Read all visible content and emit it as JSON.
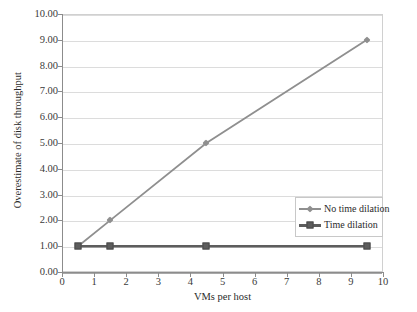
{
  "chart_data": {
    "type": "line",
    "title": "",
    "xlabel": "VMs per host",
    "ylabel": "Overestimate of disk throughput",
    "xlim": [
      0,
      10
    ],
    "ylim": [
      0,
      10
    ],
    "grid": "horizontal",
    "legend_position": "inside-right",
    "x_ticks": [
      "0",
      "1",
      "2",
      "3",
      "4",
      "5",
      "6",
      "7",
      "8",
      "9",
      "10"
    ],
    "x_tick_values": [
      0,
      1,
      2,
      3,
      4,
      5,
      6,
      7,
      8,
      9,
      10
    ],
    "y_ticks": [
      "0.00",
      "1.00",
      "2.00",
      "3.00",
      "4.00",
      "5.00",
      "6.00",
      "7.00",
      "8.00",
      "9.00",
      "10.00"
    ],
    "y_tick_values": [
      0,
      1,
      2,
      3,
      4,
      5,
      6,
      7,
      8,
      9,
      10
    ],
    "x": [
      0.5,
      1.5,
      4.5,
      9.5
    ],
    "series": [
      {
        "name": "No time dilation",
        "values": [
          1.0,
          2.0,
          5.0,
          9.0
        ],
        "color": "#8f8f8f",
        "marker": "diamond"
      },
      {
        "name": "Time dilation",
        "values": [
          1.0,
          1.0,
          1.0,
          1.0
        ],
        "color": "#5d5d5d",
        "marker": "square"
      }
    ]
  },
  "legend": {
    "entries": [
      {
        "label": "No time dilation"
      },
      {
        "label": "Time dilation"
      }
    ]
  },
  "colors": {
    "no_time_dilation": "#8f8f8f",
    "time_dilation": "#5d5d5d",
    "gridline": "#dcdcdc",
    "axis": "#8c8c8c",
    "text": "#2b2b2b"
  }
}
